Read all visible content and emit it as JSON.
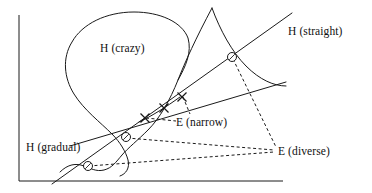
{
  "figure": {
    "background": "#ffffff",
    "stroke_color": "#1a1a1a",
    "text_color": "#101010",
    "width": 372,
    "height": 193
  },
  "axes": {
    "type": "L-frame",
    "origin": {
      "x": 19,
      "y": 181
    },
    "y_top": {
      "x": 19,
      "y": 15
    },
    "x_right": {
      "x": 283,
      "y": 181
    },
    "ticks": false,
    "grid": false,
    "x_label": "",
    "y_label": ""
  },
  "labels": [
    {
      "id": "h-crazy",
      "text": "H (crazy)",
      "x": 100,
      "y": 43
    },
    {
      "id": "h-straight",
      "text": "H (straight)",
      "x": 288,
      "y": 26
    },
    {
      "id": "e-narrow",
      "text": "E (narrow)",
      "x": 176,
      "y": 117
    },
    {
      "id": "h-gradual",
      "text": "H (gradual)",
      "x": 26,
      "y": 142
    },
    {
      "id": "e-diverse",
      "text": "E (diverse)",
      "x": 278,
      "y": 146
    }
  ],
  "curves": [
    {
      "id": "h-crazy-curve",
      "name": "crazy-hypothesis-curve",
      "style": "solid",
      "path": "M 212 8 C 196 38 185 62 178 80 C 170 100 160 118 148 130 C 138 140 128 148 122 155 C 116 162 112 168 104 170 C 96 172 90 168 84 166 C 76 163 68 164 60 172"
    },
    {
      "id": "h-crazy-loop",
      "name": "crazy-hypothesis-loop",
      "style": "solid",
      "path": "M 178 80 C 186 66 192 52 188 38 C 182 22 160 12 134 12 C 106 12 82 24 72 42 C 62 58 64 78 74 94 C 84 110 100 122 112 134 C 120 142 126 152 128 160 C 130 168 126 174 120 176"
    },
    {
      "id": "h-crazy-tail",
      "name": "crazy-hypothesis-tail",
      "style": "solid",
      "path": "M 212 8 C 220 30 232 52 246 66 C 260 80 274 86 286 86"
    },
    {
      "id": "h-straight-line",
      "name": "straight-hypothesis-line",
      "style": "solid",
      "path": "M 52 184 L 292 13"
    },
    {
      "id": "h-gradual-line",
      "name": "gradual-hypothesis-line",
      "style": "solid",
      "path": "M 70 146 L 286 82"
    },
    {
      "id": "e-narrow-arc",
      "name": "narrow-example-arc",
      "style": "solid",
      "path": "M 139 122 C 152 116 166 107 180 97"
    }
  ],
  "dashed_connectors": [
    {
      "id": "d1",
      "name": "narrow-to-mark-1",
      "from": {
        "x": 146,
        "y": 118
      },
      "to": {
        "x": 176,
        "y": 121
      }
    },
    {
      "id": "d2",
      "name": "narrow-to-mark-3",
      "from": {
        "x": 183,
        "y": 97
      },
      "to": {
        "x": 190,
        "y": 114
      }
    },
    {
      "id": "d3",
      "name": "diverse-to-circle-top",
      "from": {
        "x": 233,
        "y": 59
      },
      "to": {
        "x": 276,
        "y": 147
      }
    },
    {
      "id": "d4",
      "name": "diverse-to-circle-middle",
      "from": {
        "x": 127,
        "y": 138
      },
      "to": {
        "x": 274,
        "y": 150
      }
    },
    {
      "id": "d5",
      "name": "diverse-to-circle-bottom",
      "from": {
        "x": 89,
        "y": 166
      },
      "to": {
        "x": 274,
        "y": 152
      }
    }
  ],
  "markers": {
    "cross_points": [
      {
        "id": "x1",
        "name": "example-mark-1",
        "x": 145,
        "y": 118
      },
      {
        "id": "x2",
        "name": "example-mark-2",
        "x": 164,
        "y": 108
      },
      {
        "id": "x3",
        "name": "example-mark-3",
        "x": 182,
        "y": 97
      }
    ],
    "circle_points": [
      {
        "id": "c1",
        "name": "intersection-circle-top",
        "x": 232,
        "y": 57
      },
      {
        "id": "c2",
        "name": "intersection-circle-middle",
        "x": 126,
        "y": 137
      },
      {
        "id": "c3",
        "name": "intersection-circle-bottom",
        "x": 88,
        "y": 166
      }
    ],
    "circle_radius": 4.5,
    "cross_size": 4.5
  }
}
